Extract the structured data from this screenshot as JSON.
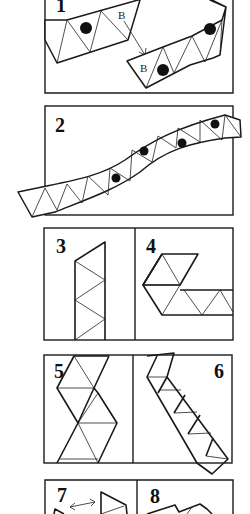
{
  "diagram": {
    "steps": [
      {
        "number": "1",
        "labels": [
          "B",
          "B"
        ],
        "has_arrow": true
      },
      {
        "number": "2"
      },
      {
        "number": "3"
      },
      {
        "number": "4"
      },
      {
        "number": "5"
      },
      {
        "number": "6"
      },
      {
        "number": "7",
        "has_double_arrow": true
      },
      {
        "number": "8"
      }
    ],
    "colors": {
      "ink": "#1a1a1a",
      "paper": "#ffffff"
    }
  }
}
